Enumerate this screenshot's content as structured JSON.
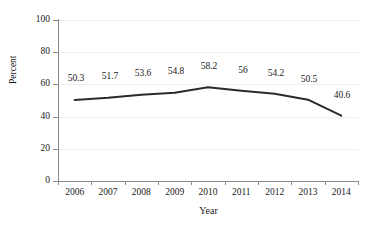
{
  "chart_data": {
    "type": "line",
    "title": "",
    "xlabel": "Year",
    "ylabel": "Percent",
    "categories": [
      "2006",
      "2007",
      "2008",
      "2009",
      "2010",
      "2011",
      "2012",
      "2013",
      "2014"
    ],
    "values": [
      50.3,
      51.7,
      53.6,
      54.8,
      58.2,
      56,
      54.2,
      50.5,
      40.6
    ],
    "data_labels": [
      "50.3",
      "51.7",
      "53.6",
      "54.8",
      "58.2",
      "56",
      "54.2",
      "50.5",
      "40.6"
    ],
    "ylim": [
      0,
      100
    ],
    "yticks": [
      0,
      20,
      40,
      60,
      80,
      100
    ],
    "ytick_labels": [
      "0",
      "20",
      "40",
      "60",
      "80",
      "100"
    ],
    "grid": true,
    "grid_axis": "y",
    "legend": "none",
    "series": [
      {
        "name": "Percent",
        "color": "#2b2b2b",
        "values": [
          50.3,
          51.7,
          53.6,
          54.8,
          58.2,
          56,
          54.2,
          50.5,
          40.6
        ]
      }
    ],
    "axis_color": "#8a8a8a",
    "gridline_color": "#f0f0f0",
    "label_color": "#1a1a1a"
  }
}
